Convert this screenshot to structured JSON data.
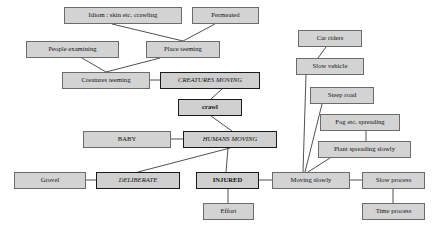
{
  "diagram": {
    "canvas": {
      "width": 432,
      "height": 233
    },
    "colors": {
      "node_fill": "#d3d3d3",
      "node_fill_emphasis": "#cfcfcf",
      "node_border": "#6b6b6b",
      "node_border_emphasis": "#1a1a1a",
      "edge": "#3c3c3c",
      "background": "#ffffff"
    },
    "nodes": [
      {
        "id": "idiom",
        "label": "Idiom : skin etc. crawling",
        "x": 64,
        "y": 7,
        "w": 118,
        "h": 17,
        "style": "plain"
      },
      {
        "id": "permeated",
        "label": "Permeated",
        "x": 192,
        "y": 7,
        "w": 67,
        "h": 17,
        "style": "plain"
      },
      {
        "id": "carriders",
        "label": "Car riders",
        "x": 298,
        "y": 30,
        "w": 64,
        "h": 17,
        "style": "plain"
      },
      {
        "id": "people",
        "label": "People examining",
        "x": 26,
        "y": 41,
        "w": 93,
        "h": 17,
        "style": "plain"
      },
      {
        "id": "place",
        "label": "Place teeming",
        "x": 146,
        "y": 41,
        "w": 74,
        "h": 17,
        "style": "plain"
      },
      {
        "id": "slowveh",
        "label": "Slow vehicle",
        "x": 296,
        "y": 58,
        "w": 68,
        "h": 17,
        "style": "plain"
      },
      {
        "id": "creatt",
        "label": "Creatures teeming",
        "x": 62,
        "y": 72,
        "w": 88,
        "h": 17,
        "style": "plain"
      },
      {
        "id": "creatm",
        "label": "CREATURES MOVING",
        "x": 160,
        "y": 72,
        "w": 100,
        "h": 17,
        "style": "italic-thick"
      },
      {
        "id": "steep",
        "label": "Steep road",
        "x": 310,
        "y": 87,
        "w": 64,
        "h": 17,
        "style": "plain"
      },
      {
        "id": "crawl",
        "label": "crawl",
        "x": 178,
        "y": 99,
        "w": 64,
        "h": 17,
        "style": "bold-thick"
      },
      {
        "id": "fog",
        "label": "Fog etc. spreading",
        "x": 320,
        "y": 114,
        "w": 80,
        "h": 17,
        "style": "plain"
      },
      {
        "id": "baby",
        "label": "BABY",
        "x": 83,
        "y": 131,
        "w": 88,
        "h": 17,
        "style": "plain"
      },
      {
        "id": "humans",
        "label": "HUMANS MOVING",
        "x": 183,
        "y": 131,
        "w": 94,
        "h": 17,
        "style": "italic-thick"
      },
      {
        "id": "plant",
        "label": "Plant spreading slowly",
        "x": 318,
        "y": 141,
        "w": 93,
        "h": 17,
        "style": "plain"
      },
      {
        "id": "grovel",
        "label": "Grovel",
        "x": 14,
        "y": 172,
        "w": 72,
        "h": 17,
        "style": "plain"
      },
      {
        "id": "delib",
        "label": "DELIBERATE",
        "x": 96,
        "y": 172,
        "w": 84,
        "h": 17,
        "style": "italic-thick"
      },
      {
        "id": "injured",
        "label": "INJURED",
        "x": 196,
        "y": 172,
        "w": 63,
        "h": 17,
        "style": "bold-thick"
      },
      {
        "id": "movslow",
        "label": "Moving slowly",
        "x": 272,
        "y": 172,
        "w": 78,
        "h": 17,
        "style": "plain"
      },
      {
        "id": "slowproc",
        "label": "Slow process",
        "x": 362,
        "y": 172,
        "w": 63,
        "h": 17,
        "style": "plain"
      },
      {
        "id": "effort",
        "label": "Effort",
        "x": 203,
        "y": 203,
        "w": 51,
        "h": 17,
        "style": "plain"
      },
      {
        "id": "timeproc",
        "label": "Time process",
        "x": 362,
        "y": 203,
        "w": 63,
        "h": 17,
        "style": "plain"
      }
    ],
    "edges": [
      {
        "id": "e-idiom-place",
        "from": "idiom",
        "to": "place",
        "x1": 112,
        "y1": 24,
        "x2": 183,
        "y2": 41
      },
      {
        "id": "e-permeated-place",
        "from": "permeated",
        "to": "place",
        "x1": 215,
        "y1": 24,
        "x2": 183,
        "y2": 41
      },
      {
        "id": "e-people-creatt",
        "from": "people",
        "to": "creatt",
        "x1": 82,
        "y1": 58,
        "x2": 106,
        "y2": 72
      },
      {
        "id": "e-place-creatt",
        "from": "place",
        "to": "creatt",
        "x1": 160,
        "y1": 58,
        "x2": 106,
        "y2": 72
      },
      {
        "id": "e-creatt-creatm",
        "from": "creatt",
        "to": "creatm",
        "x1": 150,
        "y1": 80,
        "x2": 160,
        "y2": 80
      },
      {
        "id": "e-creatm-crawl",
        "from": "creatm",
        "to": "crawl",
        "x1": 222,
        "y1": 89,
        "x2": 211,
        "y2": 99
      },
      {
        "id": "e-crawl-humans",
        "from": "crawl",
        "to": "humans",
        "x1": 211,
        "y1": 116,
        "x2": 232,
        "y2": 131
      },
      {
        "id": "e-baby-humans",
        "from": "baby",
        "to": "humans",
        "x1": 171,
        "y1": 139,
        "x2": 183,
        "y2": 139
      },
      {
        "id": "e-humans-delib",
        "from": "humans",
        "to": "delib",
        "x1": 230,
        "y1": 148,
        "x2": 138,
        "y2": 172
      },
      {
        "id": "e-humans-injured",
        "from": "humans",
        "to": "injured",
        "x1": 228,
        "y1": 148,
        "x2": 226,
        "y2": 172
      },
      {
        "id": "e-grovel-delib",
        "from": "grovel",
        "to": "delib",
        "x1": 86,
        "y1": 180,
        "x2": 96,
        "y2": 180
      },
      {
        "id": "e-injured-movslow",
        "from": "injured",
        "to": "movslow",
        "x1": 259,
        "y1": 180,
        "x2": 272,
        "y2": 180
      },
      {
        "id": "e-injured-effort",
        "from": "injured",
        "to": "effort",
        "x1": 228,
        "y1": 189,
        "x2": 228,
        "y2": 203
      },
      {
        "id": "e-carriders-slowveh",
        "from": "carriders",
        "to": "slowveh",
        "x1": 326,
        "y1": 47,
        "x2": 318,
        "y2": 58
      },
      {
        "id": "e-slowveh-movslow",
        "from": "slowveh",
        "to": "movslow",
        "x1": 306,
        "y1": 75,
        "x2": 303,
        "y2": 172
      },
      {
        "id": "e-steep-movslow",
        "from": "steep",
        "to": "movslow",
        "x1": 322,
        "y1": 104,
        "x2": 305,
        "y2": 172
      },
      {
        "id": "e-fog-plant",
        "from": "fog",
        "to": "plant",
        "x1": 366,
        "y1": 131,
        "x2": 366,
        "y2": 141
      },
      {
        "id": "e-plant-movslow",
        "from": "plant",
        "to": "movslow",
        "x1": 330,
        "y1": 158,
        "x2": 308,
        "y2": 172
      },
      {
        "id": "e-movslow-slowproc",
        "from": "movslow",
        "to": "slowproc",
        "x1": 350,
        "y1": 180,
        "x2": 362,
        "y2": 180
      },
      {
        "id": "e-slowproc-timeproc",
        "from": "slowproc",
        "to": "timeproc",
        "x1": 393,
        "y1": 189,
        "x2": 393,
        "y2": 203
      }
    ]
  }
}
